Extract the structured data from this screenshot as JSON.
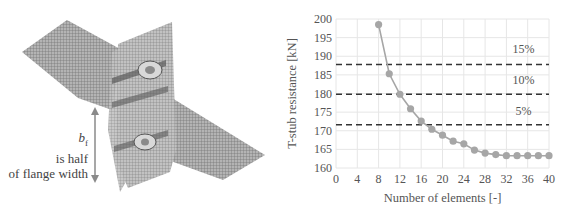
{
  "figure": {
    "annotation": {
      "symbol": "b",
      "subscript": "f",
      "line1": "is half",
      "line2": "of flange width"
    }
  },
  "chart_data": {
    "type": "line",
    "title": "",
    "xlabel": "Number of elements [-]",
    "ylabel": "T-stub resistance [kN]",
    "xlim": [
      0,
      40
    ],
    "ylim": [
      160,
      200
    ],
    "xticks": [
      0,
      4,
      8,
      12,
      16,
      20,
      24,
      28,
      32,
      36,
      40
    ],
    "yticks": [
      160,
      165,
      170,
      175,
      180,
      185,
      190,
      195,
      200
    ],
    "grid": true,
    "series": [
      {
        "name": "T-stub resistance",
        "color": "#a6a6a6",
        "marker": "circle",
        "x": [
          8,
          10,
          12,
          14,
          16,
          18,
          20,
          22,
          24,
          26,
          28,
          30,
          32,
          34,
          36,
          38,
          40
        ],
        "values": [
          198.5,
          185.3,
          179.8,
          175.9,
          172.6,
          170.4,
          168.8,
          167.2,
          166.5,
          164.8,
          164.0,
          163.6,
          163.3,
          163.3,
          163.3,
          163.3,
          163.3
        ]
      }
    ],
    "reference_lines": [
      {
        "label": "15%",
        "y": 187.8,
        "style": "dashed",
        "color": "#333333"
      },
      {
        "label": "10%",
        "y": 179.8,
        "style": "dashed",
        "color": "#333333"
      },
      {
        "label": "5%",
        "y": 171.6,
        "style": "dashed",
        "color": "#333333"
      }
    ],
    "band_labels": [
      {
        "text": "15%",
        "y": 192.0
      },
      {
        "text": "10%",
        "y": 183.6
      },
      {
        "text": "5%",
        "y": 175.4
      }
    ]
  }
}
